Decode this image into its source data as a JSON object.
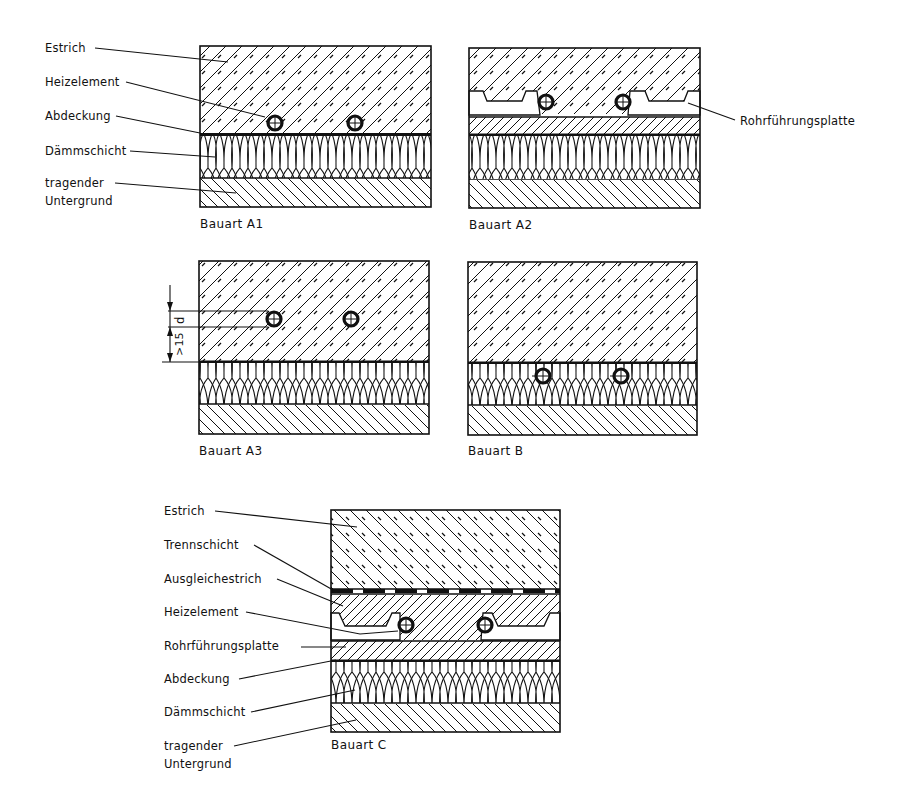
{
  "figure": {
    "type": "floor-heating construction cross-sections",
    "panels": [
      {
        "id": "A1",
        "caption": "Bauart A1",
        "labels": [
          "Estrich",
          "Heizelement",
          "Abdeckung",
          "Dämmschicht",
          "tragender",
          "Untergrund"
        ]
      },
      {
        "id": "A2",
        "caption": "Bauart A2",
        "labels": [
          "Rohrführungsplatte"
        ]
      },
      {
        "id": "A3",
        "caption": "Bauart A3",
        "dimension": {
          "upper": "d",
          "lower": ">15"
        }
      },
      {
        "id": "B",
        "caption": "Bauart B"
      },
      {
        "id": "C",
        "caption": "Bauart C",
        "labels": [
          "Estrich",
          "Trennschicht",
          "Ausgleichestrich",
          "Heizelement",
          "Rohrführungsplatte",
          "Abdeckung",
          "Dämmschicht",
          "tragender",
          "Untergrund"
        ]
      }
    ]
  },
  "a1": {
    "estrich": "Estrich",
    "heizelement": "Heizelement",
    "abdeckung": "Abdeckung",
    "daemmschicht": "Dämmschicht",
    "tragender": "tragender",
    "untergrund": "Untergrund",
    "caption": "Bauart A1"
  },
  "a2": {
    "rohrfuehrungsplatte": "Rohrführungsplatte",
    "caption": "Bauart A2"
  },
  "a3": {
    "dim_d": "d",
    "dim_15": ">15",
    "caption": "Bauart A3"
  },
  "b": {
    "caption": "Bauart B"
  },
  "c": {
    "estrich": "Estrich",
    "trennschicht": "Trennschicht",
    "ausgleichestrich": "Ausgleichestrich",
    "heizelement": "Heizelement",
    "rohrfuehrungsplatte": "Rohrführungsplatte",
    "abdeckung": "Abdeckung",
    "daemmschicht": "Dämmschicht",
    "tragender": "tragender",
    "untergrund": "Untergrund",
    "caption": "Bauart C"
  },
  "colors": {
    "ink": "#111111",
    "paper": "#ffffff"
  }
}
